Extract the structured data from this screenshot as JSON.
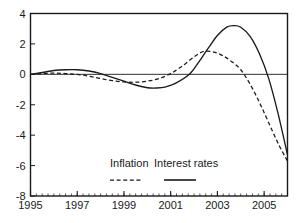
{
  "chart_data": {
    "type": "line",
    "title": "",
    "subtitle": "",
    "xlabel": "",
    "ylabel": "",
    "xlim": [
      1995,
      2006
    ],
    "ylim": [
      -8,
      4
    ],
    "grid": false,
    "zero_line": true,
    "legend_position": "inside-bottom-center",
    "x_ticks": [
      1995,
      1997,
      1999,
      2001,
      2003,
      2005
    ],
    "x_tick_labels": [
      "1995",
      "1997",
      "1999",
      "2001",
      "2003",
      "2005"
    ],
    "x_minor_tick_step": 0.25,
    "y_ticks": [
      4,
      2,
      0,
      -2,
      -4,
      -6,
      -8
    ],
    "y_tick_labels": [
      "4",
      "2",
      "0",
      "-2",
      "-4",
      "-6",
      "-8"
    ],
    "series": [
      {
        "name": "Inflation",
        "style": "dashed",
        "color": "#1a1a1a",
        "x": [
          1995.0,
          1995.5,
          1996.0,
          1996.5,
          1997.0,
          1997.5,
          1998.0,
          1998.5,
          1999.0,
          1999.5,
          2000.0,
          2000.5,
          2001.0,
          2001.5,
          2002.0,
          2002.4,
          2002.8,
          2003.2,
          2003.6,
          2004.0,
          2004.4,
          2004.8,
          2005.2,
          2005.6,
          2006.0
        ],
        "values": [
          0.0,
          0.05,
          0.08,
          0.05,
          0.0,
          -0.12,
          -0.28,
          -0.42,
          -0.5,
          -0.52,
          -0.45,
          -0.28,
          0.05,
          0.55,
          1.15,
          1.5,
          1.48,
          1.25,
          0.85,
          0.3,
          -0.65,
          -1.85,
          -3.2,
          -4.55,
          -5.7
        ]
      },
      {
        "name": "Interest rates",
        "style": "solid",
        "color": "#1a1a1a",
        "x": [
          1995.0,
          1995.5,
          1996.0,
          1996.5,
          1997.0,
          1997.5,
          1998.0,
          1998.5,
          1999.0,
          1999.5,
          2000.0,
          2000.4,
          2000.8,
          2001.2,
          2001.8,
          2002.2,
          2002.6,
          2003.0,
          2003.4,
          2003.7,
          2004.0,
          2004.4,
          2004.8,
          2005.2,
          2005.6,
          2006.0
        ],
        "values": [
          0.0,
          0.12,
          0.25,
          0.3,
          0.3,
          0.22,
          0.05,
          -0.2,
          -0.45,
          -0.7,
          -0.88,
          -0.9,
          -0.82,
          -0.6,
          0.0,
          0.8,
          1.7,
          2.55,
          3.1,
          3.2,
          3.1,
          2.5,
          1.35,
          -0.3,
          -2.6,
          -5.3
        ]
      }
    ],
    "legend": [
      {
        "label": "Inflation",
        "style": "dashed"
      },
      {
        "label": "Interest rates",
        "style": "solid"
      }
    ]
  }
}
